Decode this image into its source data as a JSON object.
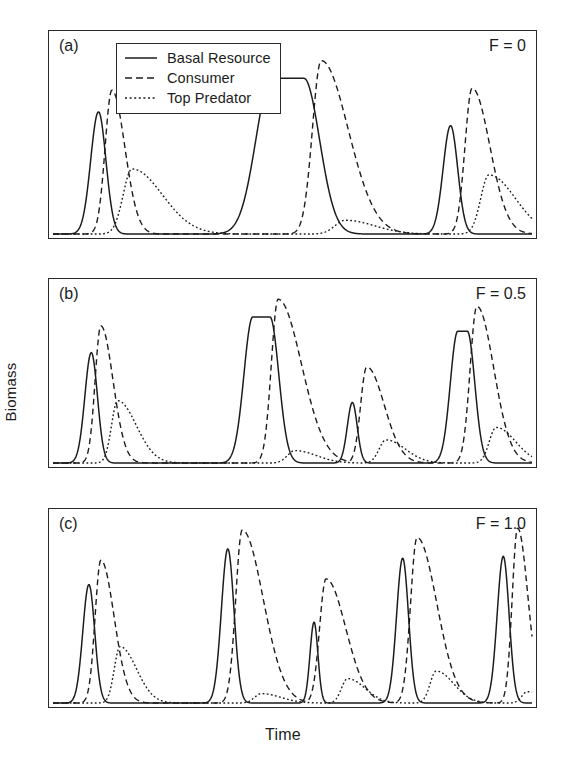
{
  "figure": {
    "xlabel": "Time",
    "ylabel": "Biomass"
  },
  "legend": {
    "items": [
      {
        "label": "Basal Resource",
        "style": "solid",
        "key": "basal-resource-key"
      },
      {
        "label": "Consumer",
        "style": "dashed",
        "key": "consumer-key"
      },
      {
        "label": "Top Predator",
        "style": "dotted",
        "key": "top-predator-key"
      }
    ]
  },
  "panels": [
    {
      "id": "a",
      "label": "(a)",
      "param": "F = 0"
    },
    {
      "id": "b",
      "label": "(b)",
      "param": "F = 0.5"
    },
    {
      "id": "c",
      "label": "(c)",
      "param": "F = 1.0"
    }
  ],
  "chart_data": {
    "type": "line",
    "title": "",
    "xlabel": "Time",
    "ylabel": "Biomass",
    "grid": false,
    "legend_position": "top-left-inset",
    "axis_ticks": false,
    "xlim": [
      0,
      100
    ],
    "ylim": [
      0,
      1
    ],
    "series_names": [
      "Basal Resource",
      "Consumer",
      "Top Predator"
    ],
    "panels": [
      {
        "id": "a",
        "label": "(a)",
        "param_label": "F = 0",
        "param_name": "F",
        "param_value": 0,
        "n_outbreaks": 3,
        "series": [
          {
            "name": "Basal Resource",
            "style": "solid",
            "peaks": [
              {
                "center": 9.5,
                "height": 0.62,
                "width": 2.3,
                "flat": 0.0
              },
              {
                "center": 49.0,
                "height": 0.79,
                "width": 4.6,
                "flat": 3.4
              },
              {
                "center": 83.0,
                "height": 0.55,
                "width": 2.2,
                "flat": 0.0
              }
            ]
          },
          {
            "name": "Consumer",
            "style": "dashed",
            "peaks": [
              {
                "center": 12.3,
                "height": 0.73,
                "width": 2.0,
                "skew": 2.0
              },
              {
                "center": 56.0,
                "height": 0.88,
                "width": 2.6,
                "skew": 3.2
              },
              {
                "center": 87.5,
                "height": 0.74,
                "width": 2.1,
                "skew": 2.6
              }
            ]
          },
          {
            "name": "Top Predator",
            "style": "dotted",
            "peaks": [
              {
                "center": 16.5,
                "height": 0.33,
                "width": 2.6,
                "skew": 3.6
              },
              {
                "center": 61.0,
                "height": 0.07,
                "width": 3.0,
                "skew": 3.0
              },
              {
                "center": 91.0,
                "height": 0.3,
                "width": 2.4,
                "skew": 3.4
              }
            ]
          }
        ]
      },
      {
        "id": "b",
        "label": "(b)",
        "param_label": "F = 0.5",
        "param_name": "F",
        "param_value": 0.5,
        "n_outbreaks": 4,
        "series": [
          {
            "name": "Basal Resource",
            "style": "solid",
            "peaks": [
              {
                "center": 8.0,
                "height": 0.62,
                "width": 1.9,
                "flat": 0.0
              },
              {
                "center": 43.5,
                "height": 0.82,
                "width": 2.6,
                "flat": 1.8
              },
              {
                "center": 62.5,
                "height": 0.34,
                "width": 1.5,
                "flat": 0.0
              },
              {
                "center": 85.5,
                "height": 0.74,
                "width": 2.2,
                "flat": 1.0
              }
            ]
          },
          {
            "name": "Consumer",
            "style": "dashed",
            "peaks": [
              {
                "center": 10.0,
                "height": 0.77,
                "width": 1.7,
                "skew": 2.2
              },
              {
                "center": 47.0,
                "height": 0.92,
                "width": 2.0,
                "skew": 3.6
              },
              {
                "center": 65.5,
                "height": 0.54,
                "width": 1.8,
                "skew": 3.0
              },
              {
                "center": 88.5,
                "height": 0.88,
                "width": 2.0,
                "skew": 2.6
              }
            ]
          },
          {
            "name": "Top Predator",
            "style": "dotted",
            "peaks": [
              {
                "center": 13.5,
                "height": 0.35,
                "width": 1.8,
                "skew": 3.2
              },
              {
                "center": 50.5,
                "height": 0.07,
                "width": 2.2,
                "skew": 3.0
              },
              {
                "center": 69.5,
                "height": 0.13,
                "width": 2.0,
                "skew": 3.0
              },
              {
                "center": 92.5,
                "height": 0.2,
                "width": 2.0,
                "skew": 3.0
              }
            ]
          }
        ]
      },
      {
        "id": "c",
        "label": "(c)",
        "param_label": "F = 1.0",
        "param_name": "F",
        "param_value": 1.0,
        "n_outbreaks": 5,
        "series": [
          {
            "name": "Basal Resource",
            "style": "solid",
            "peaks": [
              {
                "center": 7.5,
                "height": 0.63,
                "width": 1.8,
                "flat": 0.0
              },
              {
                "center": 36.5,
                "height": 0.82,
                "width": 1.9,
                "flat": 0.0
              },
              {
                "center": 54.5,
                "height": 0.43,
                "width": 1.2,
                "flat": 0.0
              },
              {
                "center": 73.0,
                "height": 0.77,
                "width": 1.8,
                "flat": 0.0
              },
              {
                "center": 94.0,
                "height": 0.78,
                "width": 1.8,
                "flat": 0.0
              }
            ]
          },
          {
            "name": "Consumer",
            "style": "dashed",
            "peaks": [
              {
                "center": 10.0,
                "height": 0.76,
                "width": 1.7,
                "skew": 2.4
              },
              {
                "center": 39.5,
                "height": 0.92,
                "width": 1.9,
                "skew": 3.4
              },
              {
                "center": 57.0,
                "height": 0.66,
                "width": 1.9,
                "skew": 3.2
              },
              {
                "center": 76.0,
                "height": 0.88,
                "width": 1.9,
                "skew": 3.2
              },
              {
                "center": 97.0,
                "height": 0.93,
                "width": 1.6,
                "skew": 2.0
              }
            ]
          },
          {
            "name": "Top Predator",
            "style": "dotted",
            "peaks": [
              {
                "center": 14.0,
                "height": 0.3,
                "width": 1.7,
                "skew": 3.0
              },
              {
                "center": 43.5,
                "height": 0.05,
                "width": 2.0,
                "skew": 3.0
              },
              {
                "center": 61.5,
                "height": 0.13,
                "width": 1.8,
                "skew": 3.0
              },
              {
                "center": 80.0,
                "height": 0.17,
                "width": 1.8,
                "skew": 3.0
              },
              {
                "center": 99.0,
                "height": 0.06,
                "width": 1.6,
                "skew": 3.0
              }
            ]
          }
        ]
      }
    ]
  }
}
